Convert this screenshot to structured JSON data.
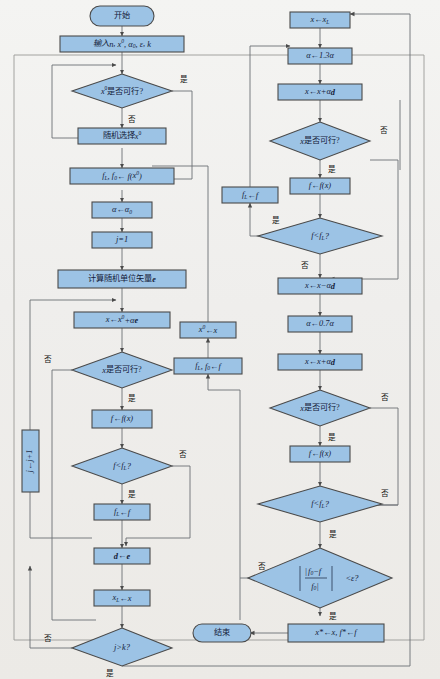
{
  "diagram": {
    "language": "zh-CN",
    "colors": {
      "node_fill": "#9cc3e5",
      "node_stroke": "#4a4a4a",
      "edge": "#6b6f74",
      "background": "#f2f2f0",
      "text": "#14213a"
    },
    "frame": {
      "visible": true
    },
    "nodes": [
      {
        "id": "start",
        "type": "terminator",
        "label": "开始"
      },
      {
        "id": "input",
        "type": "process",
        "label": "输入n, x⁰, α₀, ε, k"
      },
      {
        "id": "d_x0_feas",
        "type": "decision",
        "label": "x⁰是否可行?"
      },
      {
        "id": "rand_x0",
        "type": "process",
        "label": "随机选择x⁰"
      },
      {
        "id": "fl_f0",
        "type": "process",
        "label": "fL, f0← f(x⁰)"
      },
      {
        "id": "alpha_set",
        "type": "process",
        "label": "α←α₀"
      },
      {
        "id": "j_set",
        "type": "process",
        "label": "j=1"
      },
      {
        "id": "rand_unit",
        "type": "process",
        "label": "计算随机单位矢量e"
      },
      {
        "id": "x_upd1",
        "type": "process",
        "label": "x←x⁰+αe"
      },
      {
        "id": "d_x_feas1",
        "type": "decision",
        "label": "x是否可行?"
      },
      {
        "id": "f_eval1",
        "type": "process",
        "label": "f←f(x)"
      },
      {
        "id": "d_f_lt_fl1",
        "type": "decision",
        "label": "f<fL?"
      },
      {
        "id": "fl_upd1",
        "type": "process",
        "label": "fL←f"
      },
      {
        "id": "d_upd",
        "type": "process",
        "label": "d←e"
      },
      {
        "id": "xl_upd",
        "type": "process",
        "label": "xL←x"
      },
      {
        "id": "j_inc",
        "type": "process",
        "label": "j←j+1",
        "rotated": true
      },
      {
        "id": "d_j_gt_k",
        "type": "decision",
        "label": "j>k?"
      },
      {
        "id": "x_from_xl",
        "type": "process",
        "label": "x←xL"
      },
      {
        "id": "alpha_up",
        "type": "process",
        "label": "α←1.3α"
      },
      {
        "id": "x_plus",
        "type": "process",
        "label": "x←x+αd"
      },
      {
        "id": "d_x_feas2",
        "type": "decision",
        "label": "x是否可行?"
      },
      {
        "id": "f_eval2",
        "type": "process",
        "label": "f←f(x)"
      },
      {
        "id": "d_f_lt_fl2",
        "type": "decision",
        "label": "f<fL?"
      },
      {
        "id": "fl_upd2",
        "type": "process",
        "label": "fL←f"
      },
      {
        "id": "x_minus",
        "type": "process",
        "label": "x←x−αd"
      },
      {
        "id": "alpha_dn",
        "type": "process",
        "label": "α←0.7α"
      },
      {
        "id": "x_plus2",
        "type": "process",
        "label": "x←x+αd"
      },
      {
        "id": "d_x_feas3",
        "type": "decision",
        "label": "x是否可行?"
      },
      {
        "id": "f_eval3",
        "type": "process",
        "label": "f←f(x)"
      },
      {
        "id": "d_f_lt_fl3",
        "type": "decision",
        "label": "f<fL?"
      },
      {
        "id": "d_converge",
        "type": "decision",
        "label": "|(f0−f)/f0|<ε?"
      },
      {
        "id": "x0_from_x",
        "type": "process",
        "label": "x⁰←x"
      },
      {
        "id": "fl_f0_2",
        "type": "process",
        "label": "fL, f0←f"
      },
      {
        "id": "result",
        "type": "process",
        "label": "x*←x, f*←f"
      },
      {
        "id": "end",
        "type": "terminator",
        "label": "结束"
      }
    ],
    "branch_labels": {
      "yes": "是",
      "no": "否"
    },
    "edge_labels": [
      {
        "from": "d_x0_feas",
        "label": "是"
      },
      {
        "from": "d_x0_feas",
        "label": "否"
      },
      {
        "from": "d_x_feas1",
        "label": "否"
      },
      {
        "from": "d_x_feas1",
        "label": "是"
      },
      {
        "from": "d_f_lt_fl1",
        "label": "否"
      },
      {
        "from": "d_f_lt_fl1",
        "label": "是"
      },
      {
        "from": "d_j_gt_k",
        "label": "否"
      },
      {
        "from": "d_j_gt_k",
        "label": "是"
      },
      {
        "from": "d_x_feas2",
        "label": "否"
      },
      {
        "from": "d_x_feas2",
        "label": "是"
      },
      {
        "from": "d_f_lt_fl2",
        "label": "是"
      },
      {
        "from": "d_f_lt_fl2",
        "label": "否"
      },
      {
        "from": "d_x_feas3",
        "label": "否"
      },
      {
        "from": "d_x_feas3",
        "label": "是"
      },
      {
        "from": "d_f_lt_fl3",
        "label": "否"
      },
      {
        "from": "d_f_lt_fl3",
        "label": "是"
      },
      {
        "from": "d_converge",
        "label": "否"
      },
      {
        "from": "d_converge",
        "label": "是"
      }
    ]
  }
}
